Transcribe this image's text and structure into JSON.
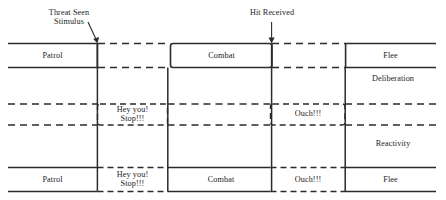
{
  "diagram": {
    "title_text": "",
    "colors": {
      "line": "#2b2b2b",
      "text": "#1c1c1c",
      "background": "#ffffff"
    },
    "annotations": [
      {
        "id": "threat-seen-stimulus",
        "line1": "Threat Seen",
        "line2": "Stimulus",
        "arrow": "diagonal-down-right"
      },
      {
        "id": "hit-received",
        "line1": "Hit Received",
        "line2": "",
        "arrow": "vertical-down"
      }
    ],
    "lane_labels": [
      {
        "id": "deliberation",
        "text": "Deliberation"
      },
      {
        "id": "reactivity",
        "text": "Reactivity"
      }
    ],
    "rows": [
      {
        "id": "deliberation-row",
        "boxes": [
          {
            "id": "patrol-top",
            "label": "Patrol",
            "border": "solid"
          },
          {
            "id": "combat-top",
            "label": "Combat",
            "border": "solid"
          },
          {
            "id": "flee-top",
            "label": "Flee",
            "border": "solid"
          }
        ]
      },
      {
        "id": "reactivity-row",
        "boxes": [
          {
            "id": "hey-you-stop-mid",
            "label": "Hey you!\nStop!!!",
            "border": "dashed"
          },
          {
            "id": "ouch-mid",
            "label": "Ouch!!!",
            "border": "dashed"
          }
        ]
      },
      {
        "id": "combined-row",
        "boxes": [
          {
            "id": "patrol-bottom",
            "label": "Patrol",
            "border": "solid"
          },
          {
            "id": "hey-you-stop-bottom",
            "label": "Hey you!\nStop!!!",
            "border": "dashed"
          },
          {
            "id": "combat-bottom",
            "label": "Combat",
            "border": "solid"
          },
          {
            "id": "ouch-bottom",
            "label": "Ouch!!!",
            "border": "dashed"
          },
          {
            "id": "flee-bottom",
            "label": "Flee",
            "border": "solid"
          }
        ]
      }
    ]
  }
}
